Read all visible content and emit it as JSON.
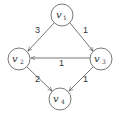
{
  "diagram": {
    "type": "directed-weighted-graph",
    "nodes": [
      {
        "id": "v1",
        "label": "v",
        "sub": "1",
        "x": 62,
        "y": 15
      },
      {
        "id": "v2",
        "label": "v",
        "sub": "2",
        "x": 19,
        "y": 59
      },
      {
        "id": "v3",
        "label": "v",
        "sub": "3",
        "x": 101,
        "y": 59
      },
      {
        "id": "v4",
        "label": "v",
        "sub": "4",
        "x": 60,
        "y": 99
      }
    ],
    "edges": [
      {
        "from": "v1",
        "to": "v2",
        "weight": "3"
      },
      {
        "from": "v1",
        "to": "v3",
        "weight": "1"
      },
      {
        "from": "v3",
        "to": "v2",
        "weight": "1"
      },
      {
        "from": "v2",
        "to": "v4",
        "weight": "2"
      },
      {
        "from": "v3",
        "to": "v4",
        "weight": "1"
      }
    ],
    "colors": {
      "stroke": "#555555",
      "text": "#333333",
      "background": "#ffffff"
    }
  }
}
